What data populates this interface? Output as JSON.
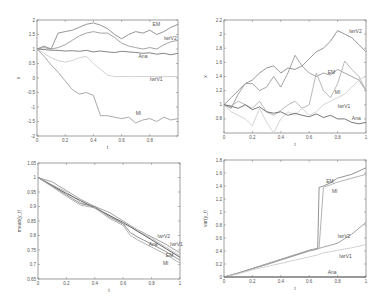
{
  "chart_data": [
    {
      "type": "line",
      "title": "",
      "xlabel": "t",
      "ylabel": "x",
      "xlim": [
        0,
        1
      ],
      "ylim": [
        -2,
        2
      ],
      "xticks": [
        0,
        0.2,
        0.4,
        0.6,
        0.8
      ],
      "yticks": [
        2,
        1.5,
        1,
        0.5,
        0,
        -0.5,
        -1,
        -1.5,
        -2
      ],
      "x": [
        0,
        0.05,
        0.1,
        0.15,
        0.2,
        0.25,
        0.3,
        0.35,
        0.4,
        0.45,
        0.5,
        0.55,
        0.6,
        0.65,
        0.7,
        0.75,
        0.8,
        0.85,
        0.9,
        0.95,
        1
      ],
      "series": [
        {
          "name": "EM",
          "color": "#8a8a8a",
          "values": [
            1,
            1.1,
            1.0,
            1.55,
            1.6,
            1.65,
            1.75,
            1.85,
            1.9,
            1.82,
            1.7,
            1.5,
            1.35,
            1.5,
            1.6,
            1.55,
            1.65,
            1.5,
            1.6,
            1.75,
            1.85
          ]
        },
        {
          "name": "IwrV2",
          "color": "#9a9a9a",
          "values": [
            1,
            1.05,
            1.0,
            1.05,
            1.15,
            1.3,
            1.45,
            1.55,
            1.6,
            1.55,
            1.55,
            1.4,
            1.2,
            1.1,
            1.05,
            1.0,
            1.05,
            1.0,
            1.15,
            1.25,
            1.3
          ]
        },
        {
          "name": "Ana",
          "color": "#777777",
          "values": [
            1,
            0.98,
            0.96,
            0.95,
            0.93,
            0.94,
            0.92,
            0.95,
            0.9,
            0.93,
            0.9,
            0.88,
            0.92,
            0.9,
            0.88,
            0.85,
            0.87,
            0.82,
            0.85,
            0.8,
            0.85
          ]
        },
        {
          "name": "IwrV1",
          "color": "#cccccc",
          "values": [
            1,
            0.85,
            0.7,
            0.6,
            0.55,
            0.6,
            0.7,
            0.75,
            0.5,
            0.3,
            0.1,
            0.05,
            0.05,
            0.05,
            0.05,
            0.05,
            0.05,
            0.05,
            0.05,
            0.05,
            0.05
          ]
        },
        {
          "name": "MI",
          "color": "#a0a0a0",
          "values": [
            1,
            0.75,
            0.45,
            0.2,
            -0.1,
            -0.4,
            -0.55,
            -0.5,
            -0.6,
            -1.3,
            -1.3,
            -1.35,
            -1.4,
            -1.35,
            -1.55,
            -1.45,
            -1.4,
            -1.5,
            -1.35,
            -1.45,
            -1.4
          ]
        }
      ],
      "labels": [
        {
          "text": "EM",
          "x": 0.82,
          "y": 1.78
        },
        {
          "text": "IwrV2",
          "x": 0.9,
          "y": 1.3
        },
        {
          "text": "Ana",
          "x": 0.72,
          "y": 0.68
        },
        {
          "text": "IwrV1",
          "x": 0.8,
          "y": -0.1
        },
        {
          "text": "MI",
          "x": 0.7,
          "y": -1.28
        }
      ]
    },
    {
      "type": "line",
      "title": "",
      "xlabel": "t",
      "ylabel": "x",
      "xlim": [
        0,
        1
      ],
      "ylim": [
        0.6,
        2.2
      ],
      "xticks": [
        0,
        0.2,
        0.4,
        0.6,
        0.8,
        1
      ],
      "yticks": [
        2.2,
        2,
        1.8,
        1.6,
        1.4,
        1.2,
        1,
        0.8
      ],
      "x": [
        0,
        0.05,
        0.1,
        0.15,
        0.2,
        0.25,
        0.3,
        0.35,
        0.4,
        0.45,
        0.5,
        0.55,
        0.6,
        0.65,
        0.7,
        0.75,
        0.8,
        0.85,
        0.9,
        0.95,
        1
      ],
      "series": [
        {
          "name": "IwrV2",
          "color": "#8a8a8a",
          "values": [
            1,
            1.1,
            1.2,
            1.3,
            1.35,
            1.45,
            1.52,
            1.55,
            1.45,
            1.52,
            1.5,
            1.55,
            1.65,
            1.75,
            1.8,
            1.9,
            2.05,
            2.0,
            1.95,
            1.85,
            1.75
          ]
        },
        {
          "name": "EM",
          "color": "#999999",
          "values": [
            1,
            0.95,
            1.15,
            1.3,
            1.3,
            1.2,
            1.25,
            1.4,
            1.25,
            1.45,
            1.7,
            1.55,
            1.45,
            1.4,
            1.45,
            1.42,
            1.5,
            1.45,
            1.4,
            1.35,
            1.2
          ]
        },
        {
          "name": "MI",
          "color": "#b0b0b0",
          "values": [
            1,
            0.98,
            1.05,
            1.0,
            0.95,
            1.05,
            0.9,
            0.85,
            0.92,
            1.0,
            1.05,
            0.95,
            1.0,
            1.45,
            1.2,
            1.1,
            1.3,
            1.62,
            1.5,
            1.4,
            1.2
          ]
        },
        {
          "name": "IwrV1",
          "color": "#d0d0d0",
          "values": [
            1,
            0.9,
            0.85,
            0.8,
            0.7,
            0.95,
            0.75,
            0.6,
            0.8,
            0.9,
            0.85,
            0.95,
            0.85,
            0.9,
            1.0,
            1.05,
            1.1,
            1.15,
            1.25,
            1.35,
            1.4
          ]
        },
        {
          "name": "Ana",
          "color": "#6a6a6a",
          "values": [
            1,
            0.98,
            0.95,
            1.0,
            0.93,
            0.97,
            0.9,
            0.88,
            0.9,
            0.85,
            0.88,
            0.85,
            0.83,
            0.87,
            0.82,
            0.85,
            0.8,
            0.8,
            0.75,
            0.73,
            0.75
          ]
        }
      ],
      "labels": [
        {
          "text": "IwrV2",
          "x": 0.88,
          "y": 2.02
        },
        {
          "text": "EM",
          "x": 0.73,
          "y": 1.44
        },
        {
          "text": "MI",
          "x": 0.78,
          "y": 1.15
        },
        {
          "text": "IwrV1",
          "x": 0.8,
          "y": 0.95
        },
        {
          "text": "Ana",
          "x": 0.9,
          "y": 0.78
        }
      ]
    },
    {
      "type": "line",
      "title": "",
      "xlabel": "t",
      "ylabel": "mean(y_t)",
      "xlim": [
        0,
        1
      ],
      "ylim": [
        0.65,
        1.05
      ],
      "xticks": [
        0,
        0.2,
        0.4,
        0.6,
        0.8,
        1
      ],
      "yticks": [
        1.05,
        1,
        0.95,
        0.9,
        0.85,
        0.8,
        0.75,
        0.7,
        0.65
      ],
      "x": [
        0,
        0.1,
        0.2,
        0.3,
        0.4,
        0.5,
        0.6,
        0.65,
        0.7,
        0.8,
        0.9,
        1
      ],
      "series": [
        {
          "name": "IwrV2",
          "color": "#9a9a9a",
          "values": [
            1,
            0.985,
            0.955,
            0.925,
            0.9,
            0.88,
            0.85,
            0.835,
            0.82,
            0.795,
            0.77,
            0.74
          ]
        },
        {
          "name": "IwrV1",
          "color": "#bbbbbb",
          "values": [
            1,
            0.975,
            0.95,
            0.915,
            0.895,
            0.87,
            0.84,
            0.83,
            0.815,
            0.79,
            0.76,
            0.73
          ]
        },
        {
          "name": "Ana",
          "color": "#555555",
          "values": [
            1,
            0.972,
            0.945,
            0.92,
            0.895,
            0.87,
            0.845,
            0.83,
            0.815,
            0.785,
            0.755,
            0.725
          ]
        },
        {
          "name": "EM",
          "color": "#888888",
          "values": [
            1,
            0.97,
            0.94,
            0.91,
            0.9,
            0.865,
            0.84,
            0.81,
            0.795,
            0.77,
            0.745,
            0.715
          ]
        },
        {
          "name": "MI",
          "color": "#aaaaaa",
          "values": [
            1,
            0.968,
            0.935,
            0.905,
            0.895,
            0.86,
            0.835,
            0.8,
            0.785,
            0.76,
            0.735,
            0.705
          ]
        }
      ],
      "labels": [
        {
          "text": "IwrV2",
          "x": 0.84,
          "y": 0.79
        },
        {
          "text": "IwrV1",
          "x": 0.93,
          "y": 0.765
        },
        {
          "text": "Ana",
          "x": 0.78,
          "y": 0.765
        },
        {
          "text": "EM",
          "x": 0.9,
          "y": 0.725
        },
        {
          "text": "MI",
          "x": 0.88,
          "y": 0.7
        }
      ]
    },
    {
      "type": "line",
      "title": "",
      "xlabel": "t",
      "ylabel": "var(y_t)",
      "xlim": [
        0,
        1
      ],
      "ylim": [
        0,
        1.8
      ],
      "xticks": [
        0,
        0.2,
        0.4,
        0.6,
        0.8,
        1
      ],
      "yticks": [
        1.8,
        1.6,
        1.4,
        1.2,
        1,
        0.8,
        0.6,
        0.4,
        0.2,
        0
      ],
      "x": [
        0,
        0.1,
        0.2,
        0.3,
        0.4,
        0.5,
        0.6,
        0.66,
        0.67,
        0.7,
        0.75,
        0.8,
        0.9,
        1
      ],
      "series": [
        {
          "name": "EM",
          "color": "#888888",
          "values": [
            0,
            0.06,
            0.13,
            0.2,
            0.27,
            0.34,
            0.41,
            0.44,
            1.38,
            1.4,
            1.45,
            1.52,
            1.58,
            1.68
          ]
        },
        {
          "name": "MI",
          "color": "#aaaaaa",
          "values": [
            0,
            0.06,
            0.13,
            0.2,
            0.27,
            0.34,
            0.41,
            0.44,
            0.45,
            1.38,
            1.42,
            1.46,
            1.52,
            1.58
          ]
        },
        {
          "name": "IwrV2",
          "color": "#999999",
          "values": [
            0,
            0.06,
            0.13,
            0.19,
            0.26,
            0.33,
            0.4,
            0.43,
            0.44,
            0.46,
            0.49,
            0.52,
            0.66,
            0.84
          ]
        },
        {
          "name": "IwrV1",
          "color": "#cccccc",
          "values": [
            0,
            0.05,
            0.11,
            0.16,
            0.21,
            0.26,
            0.31,
            0.34,
            0.35,
            0.37,
            0.39,
            0.41,
            0.45,
            0.5
          ]
        },
        {
          "name": "Ana",
          "color": "#555555",
          "values": [
            0,
            0,
            0,
            0,
            0,
            0,
            0,
            0,
            0,
            0,
            0,
            0,
            0,
            0
          ]
        }
      ],
      "labels": [
        {
          "text": "EM",
          "x": 0.72,
          "y": 1.45
        },
        {
          "text": "MI",
          "x": 0.76,
          "y": 1.3
        },
        {
          "text": "IwrV2",
          "x": 0.8,
          "y": 0.6
        },
        {
          "text": "IwrV1",
          "x": 0.81,
          "y": 0.3
        },
        {
          "text": "Ana",
          "x": 0.73,
          "y": 0.04
        }
      ]
    }
  ],
  "panels": [
    {
      "id": "top-left",
      "box": [
        37,
        20,
        178,
        136
      ]
    },
    {
      "id": "top-right",
      "box": [
        224,
        20,
        366,
        133
      ]
    },
    {
      "id": "bottom-left",
      "box": [
        38,
        163,
        180,
        279
      ]
    },
    {
      "id": "bottom-right",
      "box": [
        224,
        160,
        366,
        277
      ]
    }
  ]
}
